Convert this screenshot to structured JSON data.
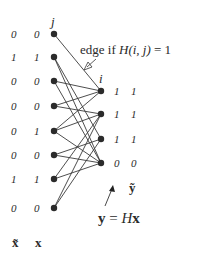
{
  "diagram": {
    "type": "bipartite-graph",
    "left_column_label": "j",
    "right_column_label": "i",
    "edge_annotation": "edge if H(i, j) = 1",
    "edge_annotation_parts": {
      "prefix": "edge if ",
      "func": "H",
      "args": "(i, j)",
      "rhs": " = 1"
    },
    "vector_labels": {
      "x_tilde": "x̃",
      "x": "x",
      "y_tilde": "ỹ",
      "equation": {
        "lhs": "y",
        "eq": " = ",
        "H": "H",
        "x": "x"
      }
    },
    "x_tilde": [
      "0",
      "1",
      "0",
      "0",
      "0",
      "0",
      "1",
      "0"
    ],
    "x": [
      "0",
      "1",
      "0",
      "0",
      "1",
      "0",
      "1",
      "0"
    ],
    "y": [
      "1",
      "1",
      "1",
      "0"
    ],
    "y_tilde": [
      "1",
      "1",
      "1",
      "0"
    ],
    "left_nodes": [
      {
        "x": 54,
        "y": 34
      },
      {
        "x": 54,
        "y": 57
      },
      {
        "x": 54,
        "y": 81
      },
      {
        "x": 54,
        "y": 106
      },
      {
        "x": 54,
        "y": 131
      },
      {
        "x": 54,
        "y": 155
      },
      {
        "x": 54,
        "y": 179
      },
      {
        "x": 54,
        "y": 208
      }
    ],
    "right_nodes": [
      {
        "x": 101,
        "y": 91
      },
      {
        "x": 101,
        "y": 114
      },
      {
        "x": 101,
        "y": 139
      },
      {
        "x": 101,
        "y": 163
      }
    ],
    "edges": [
      [
        0,
        0
      ],
      [
        1,
        2
      ],
      [
        1,
        3
      ],
      [
        2,
        0
      ],
      [
        2,
        3
      ],
      [
        3,
        0
      ],
      [
        3,
        1
      ],
      [
        4,
        0
      ],
      [
        4,
        1
      ],
      [
        4,
        3
      ],
      [
        5,
        2
      ],
      [
        5,
        3
      ],
      [
        6,
        1
      ],
      [
        6,
        3
      ],
      [
        7,
        1
      ],
      [
        7,
        2
      ]
    ],
    "colors": {
      "node": "#2b2b2b",
      "edge": "#3a3a3a",
      "text": "#2a2a2a"
    }
  }
}
